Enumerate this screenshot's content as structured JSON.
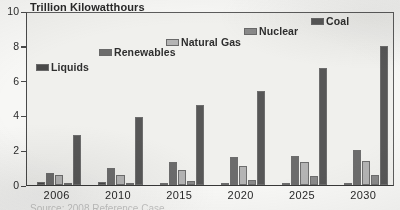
{
  "chart_data": {
    "type": "bar",
    "title": "Trillion Kilowatthours",
    "xlabel": "",
    "ylabel": "Trillion Kilowatthours",
    "categories": [
      "2006",
      "2010",
      "2015",
      "2020",
      "2025",
      "2030"
    ],
    "ylim": [
      0,
      10
    ],
    "yticks": [
      0,
      2,
      4,
      6,
      8,
      10
    ],
    "ytick_labels": [
      "0",
      "2",
      "4",
      "6",
      "8",
      "10"
    ],
    "grid": false,
    "legend_position": "inside-upper-left-staggered",
    "series": [
      {
        "name": "Liquids",
        "color": "#4a4a4a",
        "values": [
          0.15,
          0.15,
          0.12,
          0.1,
          0.1,
          0.1
        ]
      },
      {
        "name": "Renewables",
        "color": "#6d6d6d",
        "values": [
          0.7,
          1.0,
          1.3,
          1.6,
          1.65,
          2.0
        ]
      },
      {
        "name": "Natural Gas",
        "color": "#b4b4b4",
        "values": [
          0.55,
          0.6,
          0.85,
          1.1,
          1.3,
          1.4
        ]
      },
      {
        "name": "Nuclear",
        "color": "#8a8a8a",
        "values": [
          0.05,
          0.08,
          0.25,
          0.3,
          0.5,
          0.6
        ]
      },
      {
        "name": "Coal",
        "color": "#585858",
        "values": [
          2.9,
          3.9,
          4.6,
          5.4,
          6.7,
          8.0
        ]
      }
    ]
  },
  "legend": [
    {
      "label": "Liquids",
      "x": 36,
      "y": 62
    },
    {
      "label": "Renewables",
      "x": 99,
      "y": 47
    },
    {
      "label": "Natural Gas",
      "x": 166,
      "y": 37
    },
    {
      "label": "Nuclear",
      "x": 244,
      "y": 26
    },
    {
      "label": "Coal",
      "x": 311,
      "y": 16
    }
  ],
  "source_note": "Source: 2008 Reference Case"
}
